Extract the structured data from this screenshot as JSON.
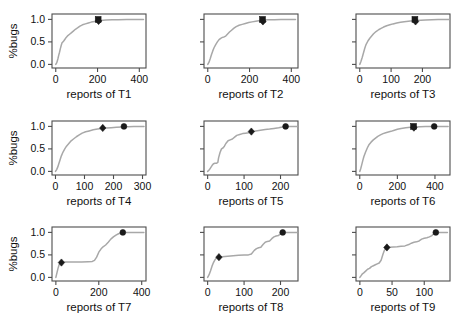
{
  "figure": {
    "type": "multi-panel-grid",
    "rows": 3,
    "cols": 3,
    "background": "#ffffff",
    "curve_color": "#a8a8a8",
    "marker_color": "#1a1a1a",
    "axis_color": "#4d4d4d"
  },
  "ylabel": "%bugs",
  "yticks": [
    "0.0",
    "0.5",
    "1.0"
  ],
  "ytick_values": [
    0.0,
    0.5,
    1.0
  ],
  "chart_data": [
    {
      "type": "line",
      "id": "T1",
      "xlabel": "reports of T1",
      "ylabel": "%bugs",
      "xticks": [
        "0",
        "200",
        "400"
      ],
      "xtick_values": [
        0,
        200,
        400
      ],
      "xlim": [
        -18,
        432
      ],
      "ylim": [
        -0.08,
        1.12
      ],
      "grid": false,
      "x": [
        0,
        5,
        10,
        14,
        18,
        22,
        26,
        30,
        34,
        38,
        44,
        50,
        58,
        66,
        74,
        84,
        94,
        104,
        116,
        128,
        142,
        156,
        170,
        186,
        200,
        215,
        240,
        270,
        300,
        340,
        380,
        420
      ],
      "y": [
        0.0,
        0.04,
        0.12,
        0.2,
        0.27,
        0.35,
        0.42,
        0.48,
        0.5,
        0.52,
        0.56,
        0.6,
        0.64,
        0.67,
        0.7,
        0.74,
        0.78,
        0.81,
        0.85,
        0.88,
        0.9,
        0.92,
        0.94,
        0.955,
        0.965,
        0.975,
        0.985,
        0.99,
        0.995,
        1.0,
        1.0,
        1.0
      ],
      "markers": [
        {
          "x": 203,
          "y": 1.0,
          "symbol": "square"
        },
        {
          "x": 205,
          "y": 0.965,
          "symbol": "diamond"
        }
      ]
    },
    {
      "type": "line",
      "id": "T2",
      "xlabel": "reports of T2",
      "ylabel": "%bugs",
      "xticks": [
        "0",
        "200",
        "400"
      ],
      "xtick_values": [
        0,
        200,
        400
      ],
      "xlim": [
        -18,
        432
      ],
      "ylim": [
        -0.08,
        1.12
      ],
      "grid": false,
      "x": [
        0,
        6,
        12,
        18,
        24,
        30,
        38,
        46,
        54,
        62,
        70,
        78,
        86,
        94,
        104,
        114,
        124,
        136,
        150,
        165,
        180,
        196,
        212,
        230,
        250,
        268,
        290,
        320,
        350,
        385,
        420
      ],
      "y": [
        0.0,
        0.05,
        0.13,
        0.22,
        0.3,
        0.37,
        0.44,
        0.5,
        0.55,
        0.58,
        0.6,
        0.61,
        0.63,
        0.67,
        0.72,
        0.76,
        0.8,
        0.84,
        0.87,
        0.89,
        0.91,
        0.93,
        0.945,
        0.96,
        0.975,
        0.985,
        0.99,
        0.995,
        1.0,
        1.0,
        1.0
      ],
      "markers": [
        {
          "x": 262,
          "y": 1.0,
          "symbol": "square"
        },
        {
          "x": 264,
          "y": 0.955,
          "symbol": "diamond"
        }
      ]
    },
    {
      "type": "line",
      "id": "T3",
      "xlabel": "reports of T3",
      "ylabel": "%bugs",
      "xticks": [
        "0",
        "100",
        "200"
      ],
      "xtick_values": [
        0,
        100,
        200
      ],
      "xlim": [
        -12,
        288
      ],
      "ylim": [
        -0.08,
        1.12
      ],
      "grid": false,
      "x": [
        0,
        4,
        8,
        12,
        16,
        20,
        26,
        32,
        38,
        44,
        52,
        60,
        68,
        76,
        86,
        96,
        106,
        118,
        130,
        142,
        155,
        168,
        180,
        195,
        210,
        230,
        250,
        270,
        285
      ],
      "y": [
        0.0,
        0.07,
        0.16,
        0.26,
        0.36,
        0.44,
        0.52,
        0.58,
        0.63,
        0.68,
        0.73,
        0.77,
        0.8,
        0.83,
        0.86,
        0.88,
        0.9,
        0.92,
        0.935,
        0.95,
        0.96,
        0.968,
        0.975,
        0.982,
        0.988,
        0.994,
        0.998,
        1.0,
        1.0
      ],
      "markers": [
        {
          "x": 176,
          "y": 1.0,
          "symbol": "square"
        },
        {
          "x": 178,
          "y": 0.955,
          "symbol": "diamond"
        }
      ]
    },
    {
      "type": "line",
      "id": "T4",
      "xlabel": "reports of T4",
      "ylabel": "%bugs",
      "xticks": [
        "0",
        "100",
        "200",
        "300"
      ],
      "xtick_values": [
        0,
        100,
        200,
        300
      ],
      "xlim": [
        -12,
        312
      ],
      "ylim": [
        -0.08,
        1.12
      ],
      "grid": false,
      "x": [
        0,
        4,
        8,
        12,
        16,
        20,
        26,
        32,
        38,
        46,
        54,
        62,
        72,
        82,
        92,
        104,
        116,
        130,
        145,
        160,
        175,
        192,
        210,
        230,
        250,
        270,
        290,
        305
      ],
      "y": [
        0.0,
        0.04,
        0.1,
        0.18,
        0.26,
        0.34,
        0.43,
        0.5,
        0.56,
        0.62,
        0.68,
        0.72,
        0.77,
        0.81,
        0.85,
        0.88,
        0.9,
        0.925,
        0.94,
        0.952,
        0.962,
        0.972,
        0.98,
        0.988,
        0.994,
        0.998,
        1.0,
        1.0
      ],
      "markers": [
        {
          "x": 163,
          "y": 0.965,
          "symbol": "diamond"
        },
        {
          "x": 236,
          "y": 1.0,
          "symbol": "circle"
        }
      ]
    },
    {
      "type": "line",
      "id": "T5",
      "xlabel": "reports of T5",
      "ylabel": "%bugs",
      "xticks": [
        "0",
        "100",
        "200"
      ],
      "xtick_values": [
        0,
        100,
        200
      ],
      "xlim": [
        -10,
        248
      ],
      "ylim": [
        -0.08,
        1.12
      ],
      "grid": false,
      "x": [
        0,
        4,
        8,
        12,
        16,
        20,
        24,
        28,
        30,
        34,
        38,
        42,
        46,
        50,
        56,
        62,
        68,
        74,
        80,
        88,
        96,
        104,
        112,
        120,
        132,
        145,
        158,
        170,
        182,
        195,
        205,
        212,
        222,
        235,
        245
      ],
      "y": [
        0.0,
        0.03,
        0.08,
        0.13,
        0.17,
        0.18,
        0.18,
        0.2,
        0.3,
        0.42,
        0.5,
        0.52,
        0.56,
        0.62,
        0.68,
        0.7,
        0.72,
        0.76,
        0.8,
        0.82,
        0.84,
        0.85,
        0.86,
        0.88,
        0.9,
        0.915,
        0.93,
        0.94,
        0.955,
        0.97,
        0.985,
        1.0,
        1.0,
        1.0,
        1.0
      ],
      "markers": [
        {
          "x": 120,
          "y": 0.885,
          "symbol": "diamond"
        },
        {
          "x": 214,
          "y": 1.0,
          "symbol": "circle"
        }
      ]
    },
    {
      "type": "line",
      "id": "T6",
      "xlabel": "reports of T6",
      "ylabel": "%bugs",
      "xticks": [
        "0",
        "200",
        "400"
      ],
      "xtick_values": [
        0,
        200,
        400
      ],
      "xlim": [
        -20,
        480
      ],
      "ylim": [
        -0.08,
        1.12
      ],
      "grid": false,
      "x": [
        0,
        5,
        10,
        16,
        22,
        30,
        40,
        50,
        60,
        72,
        84,
        96,
        110,
        124,
        138,
        152,
        166,
        180,
        200,
        220,
        245,
        270,
        295,
        320,
        350,
        380,
        410,
        440,
        470
      ],
      "y": [
        0.0,
        0.06,
        0.14,
        0.24,
        0.33,
        0.42,
        0.52,
        0.6,
        0.65,
        0.7,
        0.74,
        0.78,
        0.81,
        0.84,
        0.86,
        0.875,
        0.89,
        0.91,
        0.935,
        0.955,
        0.97,
        0.98,
        0.988,
        0.993,
        0.997,
        1.0,
        1.0,
        1.0,
        1.0
      ],
      "markers": [
        {
          "x": 286,
          "y": 1.0,
          "symbol": "square"
        },
        {
          "x": 288,
          "y": 0.972,
          "symbol": "diamond"
        },
        {
          "x": 396,
          "y": 1.0,
          "symbol": "circle"
        }
      ]
    },
    {
      "type": "line",
      "id": "T7",
      "xlabel": "reports of T7",
      "ylabel": "%bugs",
      "xticks": [
        "0",
        "200",
        "400"
      ],
      "xtick_values": [
        0,
        200,
        400
      ],
      "xlim": [
        -18,
        420
      ],
      "ylim": [
        -0.08,
        1.12
      ],
      "grid": false,
      "x": [
        0,
        5,
        10,
        15,
        20,
        25,
        30,
        40,
        60,
        90,
        120,
        150,
        170,
        180,
        190,
        200,
        210,
        220,
        232,
        244,
        256,
        268,
        280,
        292,
        305,
        320,
        340,
        365,
        390,
        410
      ],
      "y": [
        0.0,
        0.1,
        0.2,
        0.28,
        0.32,
        0.33,
        0.335,
        0.34,
        0.34,
        0.34,
        0.345,
        0.35,
        0.355,
        0.38,
        0.45,
        0.56,
        0.63,
        0.68,
        0.72,
        0.78,
        0.85,
        0.9,
        0.94,
        0.97,
        0.99,
        1.0,
        1.0,
        1.0,
        1.0,
        1.0
      ],
      "markers": [
        {
          "x": 26,
          "y": 0.33,
          "symbol": "diamond"
        },
        {
          "x": 312,
          "y": 1.0,
          "symbol": "circle"
        }
      ]
    },
    {
      "type": "line",
      "id": "T8",
      "xlabel": "reports of T8",
      "ylabel": "%bugs",
      "xticks": [
        "0",
        "100",
        "200"
      ],
      "xtick_values": [
        0,
        100,
        200
      ],
      "xlim": [
        -10,
        248
      ],
      "ylim": [
        -0.08,
        1.12
      ],
      "grid": false,
      "x": [
        0,
        4,
        8,
        12,
        16,
        20,
        24,
        28,
        32,
        40,
        55,
        70,
        85,
        100,
        112,
        120,
        128,
        134,
        140,
        146,
        152,
        158,
        164,
        170,
        176,
        182,
        188,
        194,
        200,
        208,
        220,
        235,
        245
      ],
      "y": [
        0.0,
        0.06,
        0.15,
        0.25,
        0.33,
        0.39,
        0.43,
        0.45,
        0.455,
        0.46,
        0.47,
        0.48,
        0.49,
        0.5,
        0.5,
        0.52,
        0.6,
        0.64,
        0.66,
        0.67,
        0.73,
        0.78,
        0.8,
        0.81,
        0.86,
        0.9,
        0.92,
        0.93,
        0.97,
        1.0,
        1.0,
        1.0,
        1.0
      ],
      "markers": [
        {
          "x": 31,
          "y": 0.45,
          "symbol": "diamond"
        },
        {
          "x": 206,
          "y": 1.0,
          "symbol": "circle"
        }
      ]
    },
    {
      "type": "line",
      "id": "T9",
      "xlabel": "reports of T9",
      "ylabel": "%bugs",
      "xticks": [
        "0",
        "50",
        "100"
      ],
      "xtick_values": [
        0,
        50,
        100
      ],
      "xlim": [
        -6,
        140
      ],
      "ylim": [
        -0.08,
        1.12
      ],
      "grid": false,
      "x": [
        0,
        2,
        4,
        6,
        9,
        12,
        15,
        18,
        21,
        24,
        27,
        30,
        33,
        36,
        38,
        40,
        42,
        46,
        52,
        58,
        64,
        70,
        76,
        80,
        84,
        88,
        92,
        96,
        100,
        104,
        108,
        112,
        116,
        120,
        128,
        136
      ],
      "y": [
        0.0,
        0.04,
        0.08,
        0.1,
        0.14,
        0.18,
        0.2,
        0.24,
        0.26,
        0.28,
        0.3,
        0.32,
        0.38,
        0.52,
        0.6,
        0.64,
        0.665,
        0.67,
        0.675,
        0.68,
        0.69,
        0.7,
        0.73,
        0.76,
        0.78,
        0.79,
        0.81,
        0.85,
        0.87,
        0.88,
        0.9,
        0.93,
        0.99,
        1.0,
        1.0,
        1.0
      ],
      "markers": [
        {
          "x": 42,
          "y": 0.665,
          "symbol": "diamond"
        },
        {
          "x": 118,
          "y": 1.0,
          "symbol": "circle"
        }
      ]
    }
  ]
}
